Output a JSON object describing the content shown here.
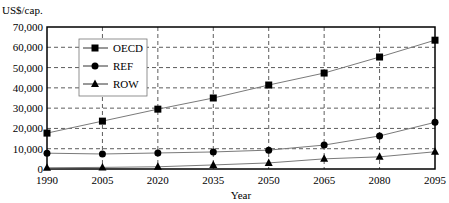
{
  "chart_data": {
    "type": "line",
    "title": "",
    "ylabel": "US$/cap.",
    "xlabel": "Year",
    "x": [
      1990,
      2005,
      2020,
      2035,
      2050,
      2065,
      2080,
      2095
    ],
    "xticks": [
      "1990",
      "2005",
      "2020",
      "2035",
      "2050",
      "2065",
      "2080",
      "2095"
    ],
    "yticks": [
      "0",
      "10,000",
      "20,000",
      "30,000",
      "40,000",
      "50,000",
      "60,000",
      "70,000"
    ],
    "ylim": [
      0,
      70000
    ],
    "grid": true,
    "legend_position": "upper left",
    "series": [
      {
        "name": "OECD",
        "marker": "square",
        "values": [
          17700,
          23600,
          29500,
          35000,
          41400,
          47300,
          55200,
          63500
        ]
      },
      {
        "name": "REF",
        "marker": "circle",
        "values": [
          7800,
          7400,
          7900,
          8400,
          9300,
          11800,
          16300,
          23000
        ]
      },
      {
        "name": "ROW",
        "marker": "triangle",
        "values": [
          600,
          800,
          1100,
          2000,
          3000,
          5000,
          6000,
          8500
        ]
      }
    ]
  },
  "colors": {
    "line": "#7a7a7a",
    "marker": "#000000",
    "grid": "#333333"
  }
}
